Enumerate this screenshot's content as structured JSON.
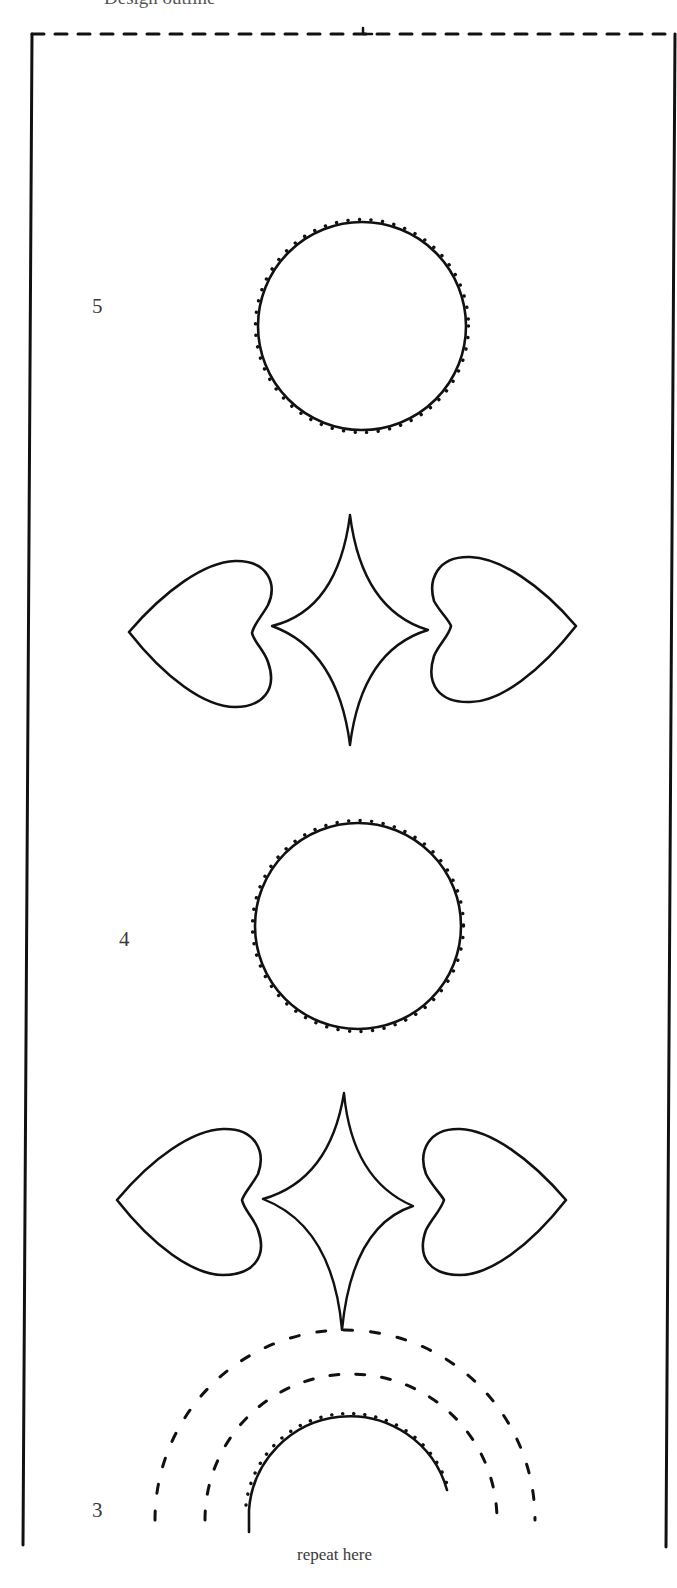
{
  "title": "Design outline",
  "section_labels": {
    "upper": "5",
    "middle": "4",
    "lower": "3"
  },
  "footer_note": "repeat here",
  "colors": {
    "ink": "#111111",
    "label_text": "#3a3a3a",
    "background": "#ffffff"
  },
  "elements": [
    {
      "type": "dashed-border-top",
      "description": "dashed top edge with center mark"
    },
    {
      "type": "solid-border-left"
    },
    {
      "type": "solid-border-right"
    },
    {
      "type": "stitched-circle",
      "section": "5"
    },
    {
      "type": "heart-star-heart-motif",
      "section": "between 5 and 4"
    },
    {
      "type": "stitched-circle",
      "section": "4"
    },
    {
      "type": "heart-star-heart-motif",
      "section": "between 4 and 3"
    },
    {
      "type": "stitched-semicircle-with-two-dashed-arcs",
      "section": "3"
    }
  ]
}
